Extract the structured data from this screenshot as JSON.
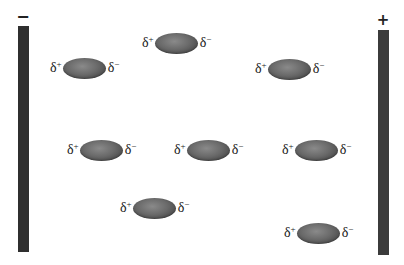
{
  "diagram": {
    "plates": {
      "left": {
        "sign": "−",
        "charge": "negative",
        "x": 18,
        "top": 26,
        "bottom": 252
      },
      "right": {
        "sign": "+",
        "charge": "positive",
        "x": 378,
        "top": 30,
        "bottom": 255
      }
    },
    "labels": {
      "partial_positive": "δ",
      "partial_positive_sup": "+",
      "partial_negative": "δ",
      "partial_negative_sup": "−"
    },
    "molecules": [
      {
        "id": 1,
        "x": 50,
        "y": 57
      },
      {
        "id": 2,
        "x": 142,
        "y": 32
      },
      {
        "id": 3,
        "x": 255,
        "y": 58
      },
      {
        "id": 4,
        "x": 67,
        "y": 139
      },
      {
        "id": 5,
        "x": 174,
        "y": 139
      },
      {
        "id": 6,
        "x": 282,
        "y": 139
      },
      {
        "id": 7,
        "x": 120,
        "y": 197
      },
      {
        "id": 8,
        "x": 284,
        "y": 222
      }
    ],
    "colors": {
      "plate": "#2f2f2f",
      "molecule": "#6a6a6a",
      "text": "#1a1a1a",
      "background": "#ffffff"
    }
  }
}
